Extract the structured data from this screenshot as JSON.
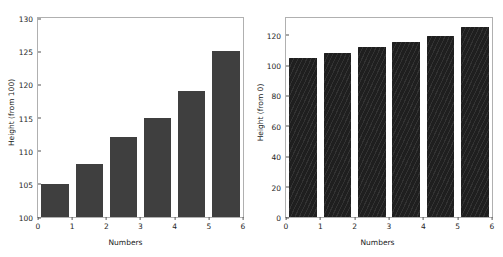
{
  "chart_data": [
    {
      "type": "bar",
      "title": "",
      "panel": "left",
      "categories": [
        "0",
        "1",
        "2",
        "3",
        "4",
        "5"
      ],
      "values": [
        105,
        108,
        112,
        115,
        119,
        125
      ],
      "xlabel": "Numbers",
      "ylabel": "Height (from 100)",
      "ylim": [
        100,
        130
      ],
      "xlim": [
        0,
        6
      ],
      "yticks": [
        "100",
        "105",
        "110",
        "115",
        "120",
        "125",
        "130"
      ],
      "ytick_values": [
        100,
        105,
        110,
        115,
        120,
        125,
        130
      ],
      "xticks": [
        "0",
        "1",
        "2",
        "3",
        "4",
        "5",
        "6"
      ],
      "xtick_values": [
        0,
        1,
        2,
        3,
        4,
        5,
        6
      ],
      "grid": false,
      "legend": "none",
      "bar_color": "#3f3f3f",
      "bar_style": "solid"
    },
    {
      "type": "bar",
      "title": "",
      "panel": "right",
      "categories": [
        "0",
        "1",
        "2",
        "3",
        "4",
        "5"
      ],
      "values": [
        105,
        108,
        112,
        115,
        119,
        125
      ],
      "xlabel": "Numbers",
      "ylabel": "Height (from 0)",
      "ylim": [
        0,
        131
      ],
      "xlim": [
        0,
        6
      ],
      "yticks": [
        "0",
        "20",
        "40",
        "60",
        "80",
        "100",
        "120"
      ],
      "ytick_values": [
        0,
        20,
        40,
        60,
        80,
        100,
        120
      ],
      "xticks": [
        "0",
        "1",
        "2",
        "3",
        "4",
        "5",
        "6"
      ],
      "xtick_values": [
        0,
        1,
        2,
        3,
        4,
        5,
        6
      ],
      "grid": false,
      "legend": "none",
      "bar_color": "#1f1f1f",
      "bar_style": "hatched"
    }
  ],
  "figure": {
    "background": "#ffffff",
    "spine_color": "#b0b0b0",
    "tick_color": "#555555",
    "text_color": "#262626"
  }
}
